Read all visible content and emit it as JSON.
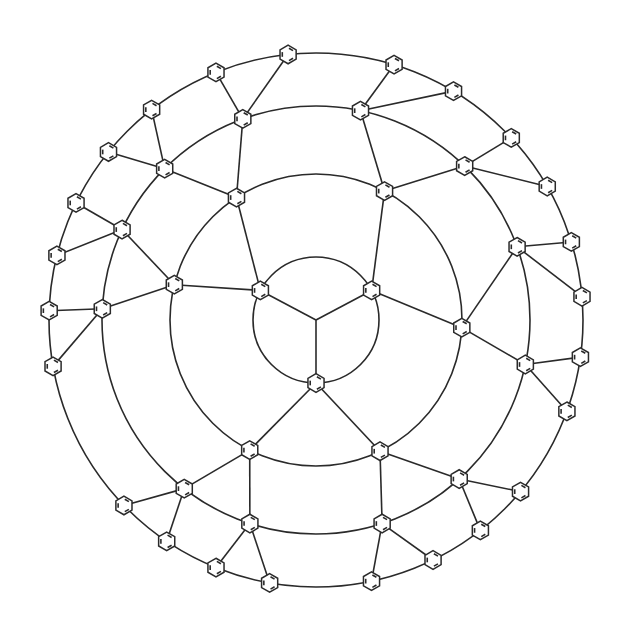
{
  "diagram": {
    "title": "",
    "type": "dendrimer-structure",
    "stroke_color": "#2a2a2a",
    "background": "#ffffff",
    "center": [
      316,
      320
    ],
    "orbits": [
      {
        "name": "generation-1-orbit",
        "radius": 63
      },
      {
        "name": "generation-2-orbit",
        "radius": 146
      },
      {
        "name": "generation-3-orbit",
        "radius": 214
      },
      {
        "name": "generation-4-orbit",
        "radius": 267
      }
    ],
    "ring_size": 15,
    "generations": [
      {
        "level": 1,
        "count": 3,
        "orbit": 0,
        "angles": [
          -152,
          -28,
          90
        ]
      },
      {
        "level": 2,
        "count": 6,
        "orbit": 1,
        "angles": [
          -123,
          -166,
          -62,
          3,
          117,
          64
        ]
      },
      {
        "level": 3,
        "count": 12,
        "orbit": 2,
        "angles": [
          -110,
          -135,
          -155,
          -177,
          -78,
          -46,
          -20,
          12,
          108,
          128,
          72,
          48
        ]
      },
      {
        "level": 4,
        "count": 24,
        "orbit": 3,
        "angles": [
          -96,
          -112,
          -128,
          -141,
          -154,
          -166,
          -178,
          170,
          -73,
          -59,
          -43,
          -30,
          -17,
          -5,
          8,
          20,
          100,
          112,
          124,
          136,
          64,
          78,
          52,
          40
        ]
      }
    ],
    "labels": []
  }
}
